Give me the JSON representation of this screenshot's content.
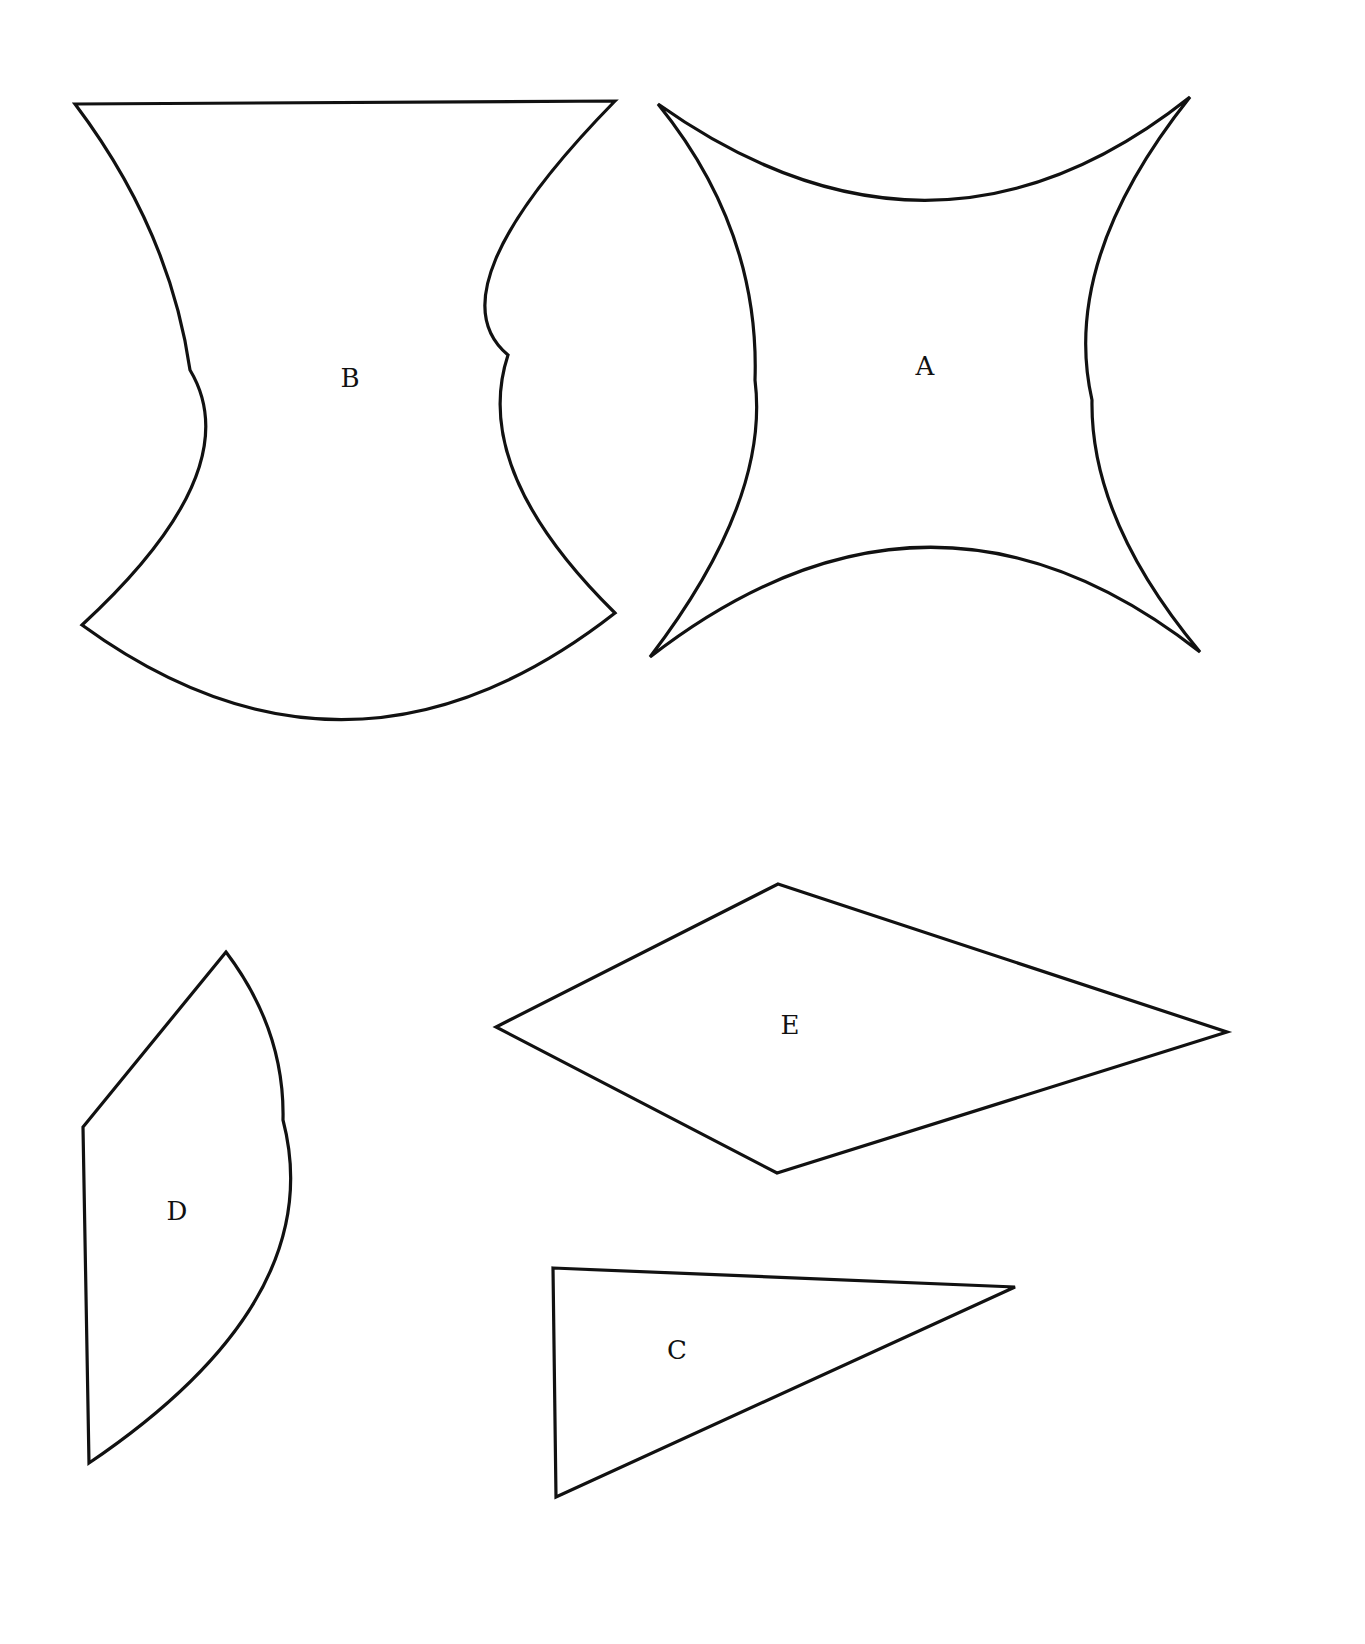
{
  "diagram": {
    "background": "#ffffff",
    "stroke_color": "#111111",
    "shapes": [
      {
        "id": "B",
        "label": "B",
        "kind": "concave-sided quadrilateral with straight top edge and convex bottom arc",
        "label_pos": [
          350,
          380
        ],
        "path": "M 75 104 L 615 101 Q 430 290 508 355 Q 470 470 615 613 Q 350 820 82 625 Q 250 470 190 370 Q 170 230 75 104 Z"
      },
      {
        "id": "A",
        "label": "A",
        "kind": "four-cusped curvilinear square (all sides concave)",
        "label_pos": [
          925,
          368
        ],
        "path": "M 658 104 Q 935 300 1190 97 Q 1060 260 1092 400 Q 1090 520 1200 652 Q 930 440 650 657 Q 770 500 755 380 Q 760 230 658 104 Z"
      },
      {
        "id": "D",
        "label": "D",
        "kind": "circular-segment pentagon (straight left edges, convex right arc)",
        "label_pos": [
          177,
          1213
        ],
        "path": "M 226 952 L 83 1127 L 89 1463 Q 330 1300 283 1120 Q 285 1030 226 952 Z"
      },
      {
        "id": "E",
        "label": "E",
        "kind": "quadrilateral (kite / rhombus-like)",
        "label_pos": [
          790,
          1027
        ],
        "path": "M 778 884 L 1227 1032 L 777 1173 L 496 1027 Z"
      },
      {
        "id": "C",
        "label": "C",
        "kind": "triangle",
        "label_pos": [
          677,
          1352
        ],
        "path": "M 553 1268 L 1015 1287 L 556 1497 Z"
      }
    ]
  }
}
